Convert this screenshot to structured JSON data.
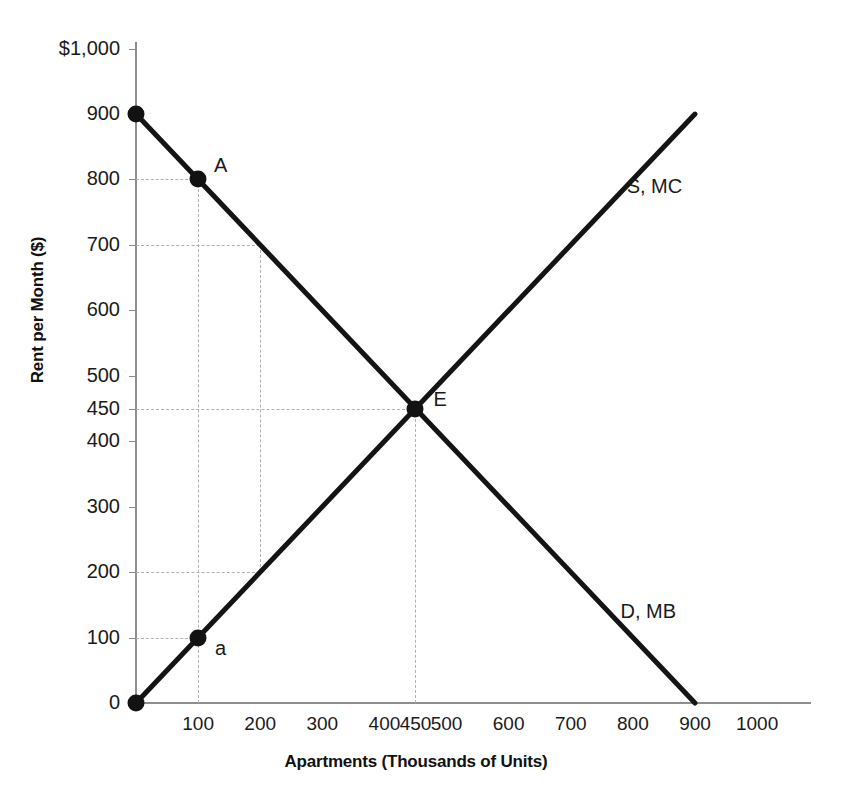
{
  "chart_data": {
    "type": "line",
    "title": "",
    "xlabel": "Apartments (Thousands of Units)",
    "ylabel": "Rent per Month ($)",
    "xlim": [
      0,
      1050
    ],
    "ylim": [
      0,
      1000
    ],
    "grid": false,
    "legend_position": "inline-right",
    "x_ticks": [
      {
        "value": 100,
        "label": "100"
      },
      {
        "value": 200,
        "label": "200"
      },
      {
        "value": 300,
        "label": "300"
      },
      {
        "value": 400,
        "label": "400"
      },
      {
        "value": 450,
        "label": "450"
      },
      {
        "value": 500,
        "label": "500"
      },
      {
        "value": 600,
        "label": "600"
      },
      {
        "value": 700,
        "label": "700"
      },
      {
        "value": 800,
        "label": "800"
      },
      {
        "value": 900,
        "label": "900"
      },
      {
        "value": 1000,
        "label": "1000"
      }
    ],
    "y_ticks": [
      {
        "value": 0,
        "label": "0"
      },
      {
        "value": 100,
        "label": "100"
      },
      {
        "value": 200,
        "label": "200"
      },
      {
        "value": 300,
        "label": "300"
      },
      {
        "value": 400,
        "label": "400"
      },
      {
        "value": 450,
        "label": "450"
      },
      {
        "value": 500,
        "label": "500"
      },
      {
        "value": 600,
        "label": "600"
      },
      {
        "value": 700,
        "label": "700"
      },
      {
        "value": 800,
        "label": "800"
      },
      {
        "value": 900,
        "label": "900"
      },
      {
        "value": 1000,
        "label": "$1,000"
      }
    ],
    "series": [
      {
        "name": "D, MB",
        "label": "D, MB",
        "label_at": {
          "x": 780,
          "y": 140
        },
        "color": "#141414",
        "points": [
          {
            "x": 0,
            "y": 900
          },
          {
            "x": 900,
            "y": 0
          }
        ]
      },
      {
        "name": "S, MC",
        "label": "S, MC",
        "label_at": {
          "x": 790,
          "y": 790
        },
        "color": "#141414",
        "points": [
          {
            "x": 0,
            "y": 0
          },
          {
            "x": 900,
            "y": 900
          }
        ]
      }
    ],
    "markers": [
      {
        "label": "",
        "x": 0,
        "y": 900,
        "dx": 0,
        "dy": 0
      },
      {
        "label": "A",
        "x": 100,
        "y": 800,
        "dx": 16,
        "dy": -14
      },
      {
        "label": "E",
        "x": 450,
        "y": 450,
        "dx": 18,
        "dy": -10
      },
      {
        "label": "a",
        "x": 100,
        "y": 100,
        "dx": 17,
        "dy": 10
      },
      {
        "label": "",
        "x": 0,
        "y": 0,
        "dx": 0,
        "dy": 0
      }
    ],
    "guides_h": [
      {
        "y": 800,
        "from_x": 0,
        "to_x": 100
      },
      {
        "y": 700,
        "from_x": 0,
        "to_x": 200
      },
      {
        "y": 450,
        "from_x": 0,
        "to_x": 450
      },
      {
        "y": 200,
        "from_x": 0,
        "to_x": 200
      },
      {
        "y": 100,
        "from_x": 0,
        "to_x": 100
      }
    ],
    "guides_v": [
      {
        "x": 100,
        "from_y": 0,
        "to_y": 800
      },
      {
        "x": 200,
        "from_y": 200,
        "to_y": 700
      },
      {
        "x": 450,
        "from_y": 0,
        "to_y": 450
      }
    ]
  }
}
